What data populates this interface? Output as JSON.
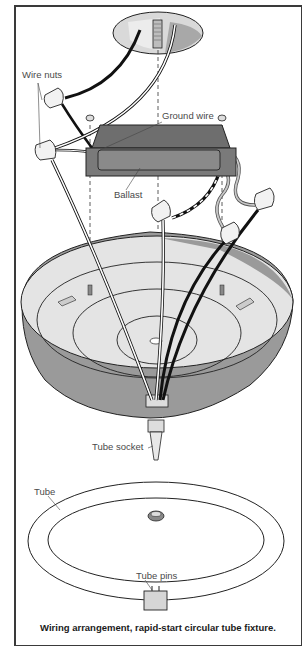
{
  "figure": {
    "title": "Wiring arrangement, rapid-start circular tube fixture.",
    "labels": {
      "wire_nuts": "Wire nuts",
      "ground_wire": "Ground wire",
      "ballast": "Ballast",
      "tube_socket": "Tube socket",
      "tube": "Tube",
      "tube_pins": "Tube pins"
    },
    "components": [
      "ceiling box",
      "mounting stud",
      "wire nuts",
      "ground wire",
      "ballast",
      "fixture pan",
      "tube socket",
      "circular tube",
      "tube pins"
    ],
    "colors": {
      "frame": "#3a3a3a",
      "ballast": "#6e6e6e",
      "pan_light": "#e4e4e4",
      "pan_shadow": "#9a9a9a",
      "wire_black": "#111111",
      "wire_white": "#ffffff",
      "line": "#222222"
    }
  }
}
